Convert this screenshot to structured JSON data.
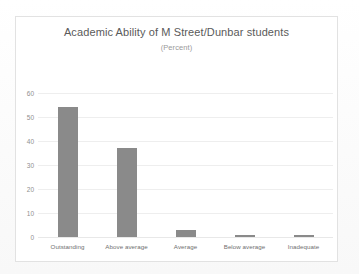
{
  "chart_data": {
    "type": "bar",
    "title": "Academic Ability of M Street/Dunbar students",
    "subtitle": "(Percent)",
    "categories": [
      "Outstanding",
      "Above average",
      "Average",
      "Below average",
      "Inadequate"
    ],
    "values": [
      54,
      37,
      3,
      1,
      1
    ],
    "xlabel": "",
    "ylabel": "",
    "ylim": [
      0,
      60
    ],
    "yticks": [
      0,
      10,
      20,
      30,
      40,
      50,
      60
    ],
    "ytick_labels": [
      "0",
      "10",
      "20",
      "30",
      "40",
      "50",
      "60"
    ],
    "grid": true,
    "legend": false,
    "bar_color": "#8a8a8a",
    "gridline_color": "#eeeeee",
    "title_color": "#5a5a5a",
    "label_color": "#6f6f6f",
    "frame_color": "#e2e2e2",
    "background": "#ffffff"
  }
}
